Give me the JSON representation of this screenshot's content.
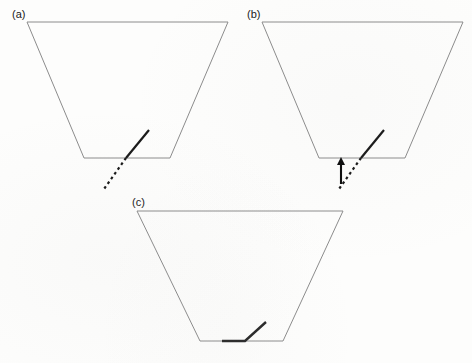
{
  "figure": {
    "background_color": "#fdfdfc",
    "outline_color": "#8c8c8c",
    "fault_color": "#1a1a1a",
    "arrow_color": "#0d0d0d",
    "width": 472,
    "height": 363
  },
  "panels": [
    {
      "id": "a",
      "label": "(a)",
      "label_x": 12,
      "label_y": 18,
      "trapezoid": {
        "points": "27,22 228,22 170,158 84,158",
        "top_left": [
          27,
          22
        ],
        "top_right": [
          228,
          22
        ],
        "bottom_right": [
          170,
          158
        ],
        "bottom_left": [
          84,
          158
        ]
      },
      "fault_solid": {
        "x1": 126,
        "y1": 158,
        "x2": 149,
        "y2": 130
      },
      "fault_dotted": {
        "x1": 126,
        "y1": 158,
        "x2": 104,
        "y2": 189
      },
      "arrow": null
    },
    {
      "id": "b",
      "label": "(b)",
      "label_x": 247,
      "label_y": 18,
      "trapezoid": {
        "points": "262,22 463,22 405,158 319,158",
        "top_left": [
          262,
          22
        ],
        "top_right": [
          463,
          22
        ],
        "bottom_right": [
          405,
          158
        ],
        "bottom_left": [
          319,
          158
        ]
      },
      "fault_solid": {
        "x1": 361,
        "y1": 158,
        "x2": 384,
        "y2": 130
      },
      "fault_dotted": {
        "x1": 361,
        "y1": 158,
        "x2": 339,
        "y2": 189
      },
      "arrow": {
        "x": 341,
        "y_tail": 184,
        "y_tip": 157,
        "head_half_width": 4,
        "head_length": 8
      }
    },
    {
      "id": "c",
      "label": "(c)",
      "label_x": 132,
      "label_y": 206,
      "trapezoid": {
        "points": "137,211 343,211 283,341 200,341",
        "top_left": [
          137,
          211
        ],
        "top_right": [
          343,
          211
        ],
        "bottom_right": [
          283,
          341
        ],
        "bottom_left": [
          200,
          341
        ]
      },
      "fault_bent": {
        "points": "222,341 245,341 266,322"
      },
      "fault_solid": null,
      "fault_dotted": null,
      "arrow": null
    }
  ]
}
